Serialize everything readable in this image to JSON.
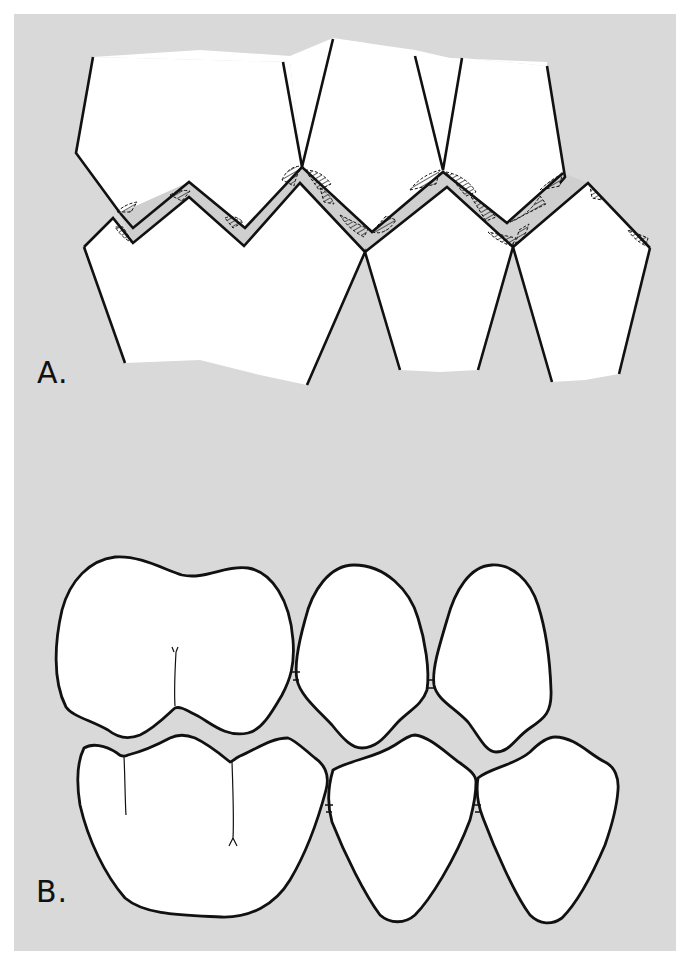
{
  "figure": {
    "background_color": "#d9d9d9",
    "tooth_fill": "#ffffff",
    "outline_color": "#111111",
    "panels": [
      {
        "id": "A",
        "label": "A.",
        "description": "Schematic of interdigitating upper and lower teeth with zigzag occlusal line and hatched contact areas",
        "upper_teeth_count": 3,
        "lower_teeth_count": 3
      },
      {
        "id": "B",
        "label": "B.",
        "description": "Anatomical outline of upper and lower molar and two premolars in occlusion",
        "upper_teeth": [
          "molar",
          "premolar",
          "premolar"
        ],
        "lower_teeth": [
          "molar",
          "premolar",
          "premolar"
        ]
      }
    ]
  }
}
